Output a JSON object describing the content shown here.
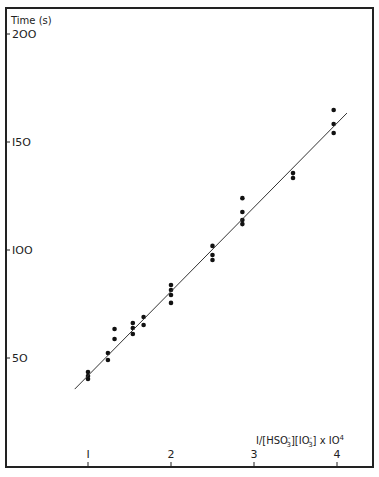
{
  "chart_data": {
    "type": "scatter",
    "title": "",
    "xlabel": "1/[HSO3-][IO3-] x 10^4",
    "xlabel_parts": {
      "main": "I/[HSO",
      "sub1": "3",
      "sup1": "-",
      "mid": "][IO",
      "sub2": "3",
      "sup2": "-",
      "end": "]  x IO",
      "exp": "4"
    },
    "ylabel": "Time (s)",
    "xlim": [
      0,
      4.4
    ],
    "ylim": [
      0,
      210
    ],
    "x_ticks": [
      1,
      2,
      3,
      4
    ],
    "x_tick_labels": [
      "I",
      "2",
      "3",
      "4"
    ],
    "y_ticks": [
      50,
      100,
      150,
      200
    ],
    "y_tick_labels": [
      "5O",
      "IOO",
      "I5O",
      "2OO"
    ],
    "grid": false,
    "legend": null,
    "series": [
      {
        "name": "measured",
        "kind": "points",
        "x": [
          1.0,
          1.0,
          1.0,
          1.24,
          1.24,
          1.32,
          1.32,
          1.54,
          1.54,
          1.54,
          1.67,
          1.67,
          2.0,
          2.0,
          2.0,
          2.0,
          2.5,
          2.5,
          2.5,
          2.86,
          2.86,
          2.86,
          2.86,
          3.47,
          3.47,
          3.96,
          3.96,
          3.96
        ],
        "y": [
          43.5,
          41.7,
          40.3,
          52.3,
          49.1,
          63.4,
          58.8,
          66.2,
          63.9,
          61.1,
          69.0,
          65.3,
          83.8,
          81.5,
          79.2,
          75.5,
          101.9,
          97.7,
          95.4,
          124.0,
          117.6,
          113.9,
          112.0,
          135.6,
          133.3,
          164.8,
          158.3,
          154.2
        ]
      },
      {
        "name": "linear fit",
        "kind": "line",
        "x": [
          0.84,
          4.12
        ],
        "y": [
          35.6,
          163.4
        ]
      }
    ]
  }
}
